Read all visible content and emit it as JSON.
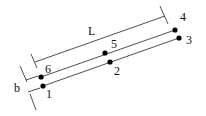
{
  "diagram": {
    "type": "beam-element-schematic",
    "dimensions": {
      "length_label": "L",
      "width_label": "b"
    },
    "nodes": [
      {
        "id": "1",
        "label": "1",
        "x": 43,
        "y": 86,
        "lx": 46,
        "ly": 98
      },
      {
        "id": "2",
        "label": "2",
        "x": 110,
        "y": 62,
        "lx": 114,
        "ly": 75
      },
      {
        "id": "3",
        "label": "3",
        "x": 179,
        "y": 38,
        "lx": 186,
        "ly": 44
      },
      {
        "id": "4",
        "label": "4",
        "x": 175,
        "y": 30,
        "lx": 180,
        "ly": 21
      },
      {
        "id": "5",
        "label": "5",
        "x": 105,
        "y": 53,
        "lx": 111,
        "ly": 48
      },
      {
        "id": "6",
        "label": "6",
        "x": 41,
        "y": 77,
        "lx": 45,
        "ly": 73
      }
    ],
    "colors": {
      "line": "#222222",
      "node": "#000000",
      "background": "#ffffff"
    }
  }
}
